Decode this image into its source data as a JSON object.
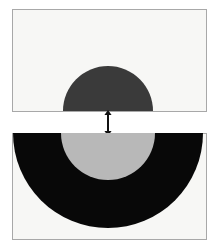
{
  "figure": {
    "width": 218,
    "height": 249,
    "background_color": "#ffffff"
  },
  "colors": {
    "panel_fill": "#f7f7f5",
    "panel_border": "#a8a8a8",
    "dark_gray_disc": "#3a3a3a",
    "black_disc": "#080808",
    "light_gray_disc": "#b8b8b8",
    "arrow": "#111111",
    "page_background": "#ffffff"
  },
  "panels": [
    {
      "id": "top",
      "name": "top-panel",
      "x": 12,
      "y": 9,
      "width": 195,
      "height": 103,
      "shapes": [
        {
          "name": "dark-gray-half-disc",
          "type": "semicircle",
          "orientation": "upward",
          "center_x": 96,
          "center_y": 102,
          "radius": 45,
          "fill": "#3a3a3a"
        }
      ]
    },
    {
      "id": "bottom",
      "name": "bottom-panel",
      "x": 12,
      "y": 133,
      "width": 195,
      "height": 107,
      "shapes": [
        {
          "name": "black-half-disc",
          "type": "semicircle",
          "orientation": "downward",
          "center_x": 96,
          "center_y": 0,
          "radius": 95,
          "fill": "#080808"
        },
        {
          "name": "light-gray-half-disc",
          "type": "semicircle",
          "orientation": "downward",
          "center_x": 96,
          "center_y": 0,
          "radius": 47,
          "fill": "#b8b8b8"
        }
      ]
    }
  ],
  "connector": {
    "name": "double-headed-arrow",
    "type": "double-arrow-vertical",
    "x": 108,
    "y_top": 110,
    "y_bottom": 136,
    "color": "#111111",
    "stroke_width": 2,
    "head_size": 5
  }
}
